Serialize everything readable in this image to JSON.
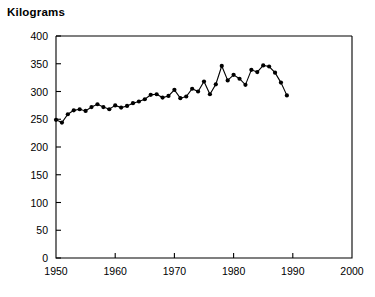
{
  "chart_data": {
    "type": "line",
    "title": "Kilograms",
    "xlabel": "",
    "ylabel": "Kilograms",
    "grid": false,
    "legend": false,
    "marker": "filled-circle",
    "line_color": "#000000",
    "xlim": [
      1950,
      2000
    ],
    "ylim": [
      0,
      400
    ],
    "xticks": [
      1950,
      1960,
      1970,
      1980,
      1990,
      2000
    ],
    "yticks": [
      0,
      50,
      100,
      150,
      200,
      250,
      300,
      350,
      400
    ],
    "xtick_labels": [
      "1950",
      "1960",
      "1970",
      "1980",
      "1990",
      "2000"
    ],
    "ytick_labels": [
      "0",
      "50",
      "100",
      "150",
      "200",
      "250",
      "300",
      "350",
      "400"
    ],
    "x": [
      1950,
      1951,
      1952,
      1953,
      1954,
      1955,
      1956,
      1957,
      1958,
      1959,
      1960,
      1961,
      1962,
      1963,
      1964,
      1965,
      1966,
      1967,
      1968,
      1969,
      1970,
      1971,
      1972,
      1973,
      1974,
      1975,
      1976,
      1977,
      1978,
      1979,
      1980,
      1981,
      1982,
      1983,
      1984,
      1985,
      1986,
      1987,
      1988,
      1989
    ],
    "values": [
      249,
      244,
      259,
      266,
      268,
      265,
      272,
      277,
      272,
      268,
      275,
      271,
      274,
      279,
      282,
      286,
      294,
      295,
      289,
      292,
      303,
      288,
      291,
      305,
      300,
      318,
      295,
      313,
      346,
      320,
      330,
      323,
      312,
      339,
      335,
      347,
      345,
      334,
      316,
      293
    ],
    "annotations": []
  },
  "axes": {
    "y_axis_name": "y-axis",
    "x_axis_name": "x-axis"
  }
}
